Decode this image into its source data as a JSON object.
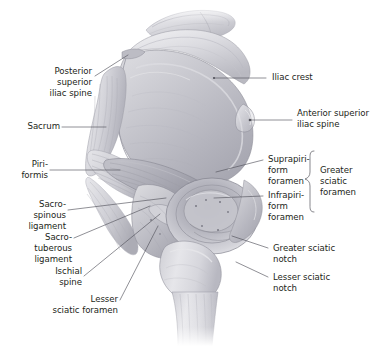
{
  "figure": {
    "background_color": "#ffffff",
    "line_color": "#4a4a52",
    "text_color": "#231f20",
    "bone_tone_light": "#e9e9ec",
    "bone_tone_mid": "#c9c9cf",
    "bone_tone_dark": "#96969e",
    "structures": [
      "ilium",
      "sacrum",
      "piriformis muscle",
      "sacrospinous ligament",
      "sacrotuberous ligament",
      "ischial spine",
      "acetabulum",
      "femur"
    ]
  },
  "labels": {
    "posterior_superior_iliac_spine": "Posterior\nsuperior\niliac spine",
    "sacrum": "Sacrum",
    "piriformis": "Piri-\nformis",
    "sacrospinous_ligament": "Sacro-\nspinous\nligament",
    "sacrotuberous_ligament": "Sacro-\ntuberous\nligament",
    "ischial_spine": "Ischial\nspine",
    "lesser_sciatic_foramen": "Lesser\nsciatic foramen",
    "iliac_crest": "Iliac crest",
    "anterior_superior_iliac_spine": "Anterior superior\niliac spine",
    "suprapiriform_foramen": "Suprapiri-\nform\nforamen",
    "infrapiriform_foramen": "Infrapiri-\nform\nforamen",
    "greater_sciatic_foramen": "Greater\nsciatic\nforamen",
    "greater_sciatic_notch": "Greater sciatic\nnotch",
    "lesser_sciatic_notch": "Lesser sciatic\nnotch"
  }
}
